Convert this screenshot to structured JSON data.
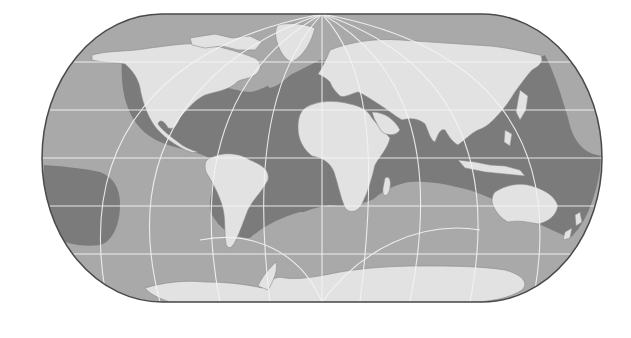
{
  "map": {
    "type": "world-map",
    "projection": "oblique pseudo-cylindrical with pole lines",
    "style": "grayscale",
    "layers": [
      {
        "name": "land",
        "color": "#e2e2e2"
      },
      {
        "name": "light-ocean",
        "color": "#a9a9a9"
      },
      {
        "name": "dark-ocean-zone",
        "color": "#7b7b7b"
      },
      {
        "name": "graticule",
        "color": "#f2f2f2"
      },
      {
        "name": "outline",
        "color": "#4a4a4a"
      }
    ],
    "continents": [
      "North America",
      "South America",
      "Europe",
      "Africa",
      "Asia",
      "Australia",
      "Antarctica",
      "Greenland"
    ],
    "labels": []
  }
}
